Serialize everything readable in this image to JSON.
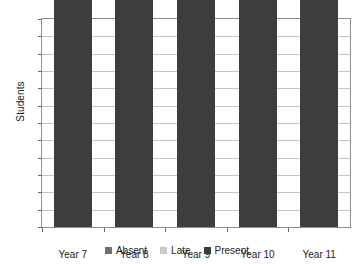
{
  "chart_data": {
    "type": "bar",
    "subtype": "stacked-bar",
    "title": "",
    "xlabel": "",
    "ylabel": "Students",
    "categories": [
      "Year 7",
      "Year 8",
      "Year 9",
      "Year 10",
      "Year 11"
    ],
    "series": [
      {
        "name": "Present",
        "values": [
          90,
          91,
          84,
          80,
          75
        ],
        "color": "#3d3d3d"
      },
      {
        "name": "Late",
        "values": [
          5,
          5,
          2,
          19,
          9
        ],
        "color": "#c9c9c9"
      },
      {
        "name": "Absent",
        "values": [
          15,
          19,
          20,
          5,
          1
        ],
        "color": "#707070"
      }
    ],
    "stack_order": [
      "Present",
      "Late",
      "Absent"
    ],
    "stack_totals": [
      110,
      115,
      106,
      104,
      85
    ],
    "ylim": [
      60,
      120
    ],
    "ytick_step": 5,
    "yticks": [
      60,
      65,
      70,
      75,
      80,
      85,
      90,
      95,
      100,
      105,
      110,
      115,
      120
    ],
    "ytick_labels": [
      "60",
      "65",
      "70",
      "75",
      "80",
      "85",
      "90",
      "95",
      "100",
      "105",
      "110",
      "115",
      "120"
    ],
    "grid": true,
    "grid_axis": "y",
    "legend_position": "bottom",
    "legend_entries": [
      "Absent",
      "Late",
      "Present"
    ],
    "background_color": "#ffffff",
    "axis_color": "#8d8d8d",
    "gridline_color": "#c4c4c4"
  }
}
